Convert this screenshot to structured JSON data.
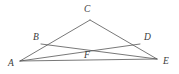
{
  "figure": {
    "background_color": "#ffffff",
    "line_color": "#555555",
    "label_color": "#3a3a3a",
    "viewbox": {
      "width": 179,
      "height": 74
    },
    "points": [
      {
        "id": "A",
        "label": "A",
        "x": 20,
        "y": 61,
        "label_x": 8,
        "label_y": 59
      },
      {
        "id": "B",
        "label": "B",
        "x": 41,
        "y": 44,
        "label_x": 33,
        "label_y": 33
      },
      {
        "id": "C",
        "label": "C",
        "x": 90,
        "y": 20,
        "label_x": 84,
        "label_y": 5
      },
      {
        "id": "D",
        "label": "D",
        "x": 140,
        "y": 44,
        "label_x": 144,
        "label_y": 33
      },
      {
        "id": "E",
        "label": "E",
        "x": 157,
        "y": 59,
        "label_x": 163,
        "label_y": 57
      },
      {
        "id": "F",
        "label": "F",
        "x": 88,
        "y": 48,
        "label_x": 84,
        "label_y": 51
      }
    ],
    "segments": [
      {
        "id": "AC",
        "from": "A",
        "to": "C",
        "description": "side A to C through B"
      },
      {
        "id": "CE",
        "from": "C",
        "to": "E",
        "description": "side C to E through D"
      },
      {
        "id": "AE",
        "from": "A",
        "to": "E",
        "description": "base A to E through F"
      },
      {
        "id": "AD",
        "from": "A",
        "to": "D",
        "description": "cevian A to D through F"
      },
      {
        "id": "BE",
        "from": "B",
        "to": "E",
        "description": "cevian B to E through F"
      }
    ]
  }
}
